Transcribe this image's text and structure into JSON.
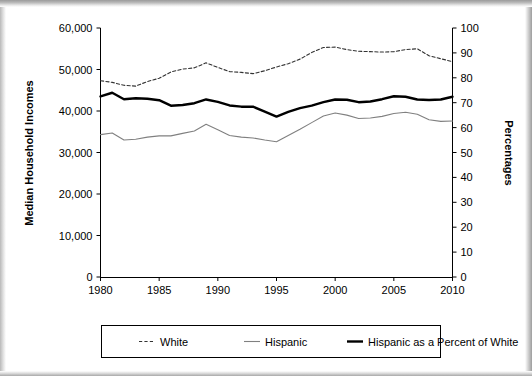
{
  "chart_data": {
    "type": "line",
    "title": "",
    "xlabel": "",
    "ylabel": "Median Household Incomes",
    "ylabel_right": "Percentages",
    "xlim": [
      1980,
      2010
    ],
    "ylim": [
      0,
      60000
    ],
    "ylim_right": [
      0,
      100
    ],
    "grid": false,
    "legend_position": "bottom",
    "x_ticks": [
      "1980",
      "1985",
      "1990",
      "1995",
      "2000",
      "2005",
      "2010"
    ],
    "x_tick_values": [
      1980,
      1985,
      1990,
      1995,
      2000,
      2005,
      2010
    ],
    "y_ticks": [
      "0",
      "10,000",
      "20,000",
      "30,000",
      "40,000",
      "50,000",
      "60,000"
    ],
    "y_tick_values": [
      0,
      10000,
      20000,
      30000,
      40000,
      50000,
      60000
    ],
    "y_ticks_right": [
      "0",
      "10",
      "20",
      "30",
      "40",
      "50",
      "60",
      "70",
      "80",
      "90",
      "100"
    ],
    "y_tick_values_right": [
      0,
      10,
      20,
      30,
      40,
      50,
      60,
      70,
      80,
      90,
      100
    ],
    "x": [
      1980,
      1981,
      1982,
      1983,
      1984,
      1985,
      1986,
      1987,
      1988,
      1989,
      1990,
      1991,
      1992,
      1993,
      1994,
      1995,
      1996,
      1997,
      1998,
      1999,
      2000,
      2001,
      2002,
      2003,
      2004,
      2005,
      2006,
      2007,
      2008,
      2009,
      2010
    ],
    "series": [
      {
        "name": "White",
        "axis": "left",
        "style": "dashed",
        "color": "#333333",
        "values": [
          47300,
          46900,
          46200,
          46000,
          47100,
          47900,
          49400,
          50100,
          50400,
          51600,
          50500,
          49500,
          49300,
          49000,
          49700,
          50600,
          51400,
          52500,
          54100,
          55300,
          55400,
          54800,
          54400,
          54300,
          54200,
          54300,
          54800,
          55000,
          53300,
          52600,
          51900
        ],
        "right_axis_equivalent": [
          78.8,
          78.2,
          77.0,
          76.7,
          78.5,
          79.8,
          82.3,
          83.5,
          84.0,
          86.0,
          84.2,
          82.5,
          82.2,
          81.7,
          82.8,
          84.3,
          85.7,
          87.5,
          90.2,
          92.2,
          92.3,
          91.3,
          90.7,
          90.5,
          90.3,
          90.5,
          91.3,
          91.7,
          88.8,
          87.7,
          86.5
        ]
      },
      {
        "name": "Hispanic",
        "axis": "left",
        "style": "solid-thin",
        "color": "#808080",
        "values": [
          34300,
          34700,
          33000,
          33200,
          33700,
          34000,
          34000,
          34600,
          35200,
          36800,
          35500,
          34100,
          33700,
          33500,
          33000,
          32600,
          34100,
          35600,
          37200,
          38800,
          39500,
          39000,
          38200,
          38300,
          38700,
          39400,
          39700,
          39200,
          37900,
          37500,
          37600
        ],
        "right_axis_equivalent": [
          57.2,
          57.8,
          55.0,
          55.3,
          56.2,
          56.7,
          56.7,
          57.7,
          58.7,
          61.3,
          59.2,
          56.8,
          56.2,
          55.8,
          55.0,
          54.3,
          56.8,
          59.3,
          62.0,
          64.7,
          65.8,
          65.0,
          63.7,
          63.8,
          64.5,
          65.7,
          66.2,
          65.3,
          63.2,
          62.5,
          62.7
        ]
      },
      {
        "name": "Hispanic as a Percent of White",
        "axis": "right",
        "style": "solid-thick",
        "color": "#000000",
        "values": [
          72.5,
          74.0,
          71.4,
          71.8,
          71.6,
          71.0,
          68.8,
          69.1,
          69.8,
          71.3,
          70.3,
          68.9,
          68.4,
          68.4,
          66.4,
          64.4,
          66.3,
          67.8,
          68.8,
          70.2,
          71.3,
          71.2,
          70.2,
          70.5,
          71.4,
          72.6,
          72.4,
          71.3,
          71.1,
          71.3,
          72.4
        ]
      }
    ],
    "legend": [
      {
        "label": "White",
        "style": "dashed",
        "color": "#333333"
      },
      {
        "label": "Hispanic",
        "style": "solid-thin",
        "color": "#808080"
      },
      {
        "label": "Hispanic as a Percent of White",
        "style": "solid-thick",
        "color": "#000000"
      }
    ]
  }
}
